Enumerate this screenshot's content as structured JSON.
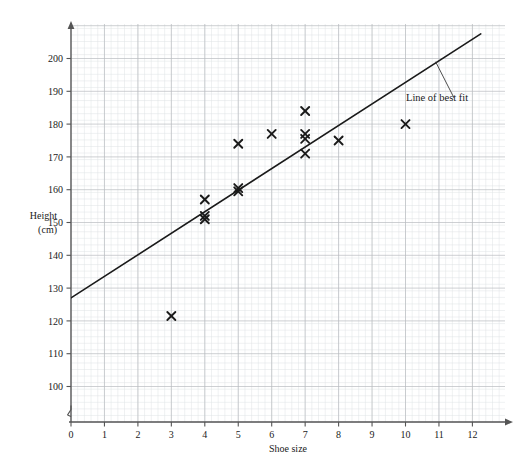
{
  "chart_data": {
    "type": "scatter",
    "title": "Scatter diagram for all boys from stratified sample",
    "xlabel": "Shoe size",
    "ylabel_line1": "Height",
    "ylabel_line2": "(cm)",
    "xlim": [
      0,
      13
    ],
    "ylim": [
      95,
      208
    ],
    "xticks": [
      "0",
      "1",
      "2",
      "3",
      "4",
      "5",
      "6",
      "7",
      "8",
      "9",
      "10",
      "11",
      "12"
    ],
    "xtick_values": [
      0,
      1,
      2,
      3,
      4,
      5,
      6,
      7,
      8,
      9,
      10,
      11,
      12
    ],
    "yticks": [
      "100",
      "110",
      "120",
      "130",
      "140",
      "150",
      "160",
      "170",
      "180",
      "190",
      "200"
    ],
    "ytick_values": [
      100,
      110,
      120,
      130,
      140,
      150,
      160,
      170,
      180,
      190,
      200
    ],
    "grid": true,
    "grid_minor": true,
    "y_axis_break": true,
    "marker": "x-cross",
    "points": [
      {
        "x": 3,
        "y": 121.5
      },
      {
        "x": 4,
        "y": 157
      },
      {
        "x": 4,
        "y": 152
      },
      {
        "x": 4,
        "y": 151
      },
      {
        "x": 5,
        "y": 174
      },
      {
        "x": 5,
        "y": 160.5
      },
      {
        "x": 5,
        "y": 159.5
      },
      {
        "x": 6,
        "y": 177
      },
      {
        "x": 7,
        "y": 184
      },
      {
        "x": 7,
        "y": 177
      },
      {
        "x": 7,
        "y": 175.5
      },
      {
        "x": 7,
        "y": 171
      },
      {
        "x": 8,
        "y": 175
      },
      {
        "x": 10,
        "y": 180
      }
    ],
    "trendline": {
      "label": "Line of best fit",
      "x1": 0,
      "y1": 127,
      "x2": 12.25,
      "y2": 207.5
    },
    "annotation": {
      "text": "Line of best fit",
      "leader_from_x": 10.9,
      "leader_from_y": 199,
      "leader_to_x": 11.45,
      "leader_to_y": 188
    },
    "colors": {
      "marker": "#1a1a1a",
      "line": "#1a1a1a",
      "axis": "#555555",
      "grid_major": "#b9bcc0",
      "grid_minor": "#dfe2e4",
      "text": "#1a1a1a",
      "background": "#ffffff"
    }
  }
}
